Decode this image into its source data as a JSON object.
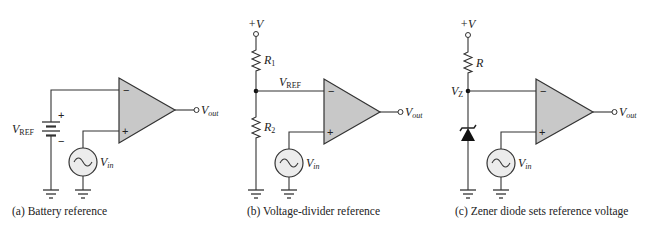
{
  "figure": {
    "panels": [
      {
        "id": "a",
        "caption": "(a) Battery reference",
        "labels": {
          "vref_main": "V",
          "vref_sub": "REF",
          "battery_plus": "+",
          "battery_minus": "−",
          "opamp_minus": "−",
          "opamp_plus": "+",
          "vout_main": "V",
          "vout_sub": "out",
          "vin_main": "V",
          "vin_sub": "in"
        }
      },
      {
        "id": "b",
        "caption": "(b) Voltage-divider reference",
        "labels": {
          "supply": "+V",
          "r1_main": "R",
          "r1_sub": "1",
          "r2_main": "R",
          "r2_sub": "2",
          "vref_main": "V",
          "vref_sub": "REF",
          "opamp_minus": "−",
          "opamp_plus": "+",
          "vout_main": "V",
          "vout_sub": "out",
          "vin_main": "V",
          "vin_sub": "in"
        }
      },
      {
        "id": "c",
        "caption": "(c) Zener diode sets reference voltage",
        "labels": {
          "supply": "+V",
          "r_main": "R",
          "vz_main": "V",
          "vz_sub": "Z",
          "opamp_minus": "−",
          "opamp_plus": "+",
          "vout_main": "V",
          "vout_sub": "out",
          "vin_main": "V",
          "vin_sub": "in"
        }
      }
    ]
  }
}
